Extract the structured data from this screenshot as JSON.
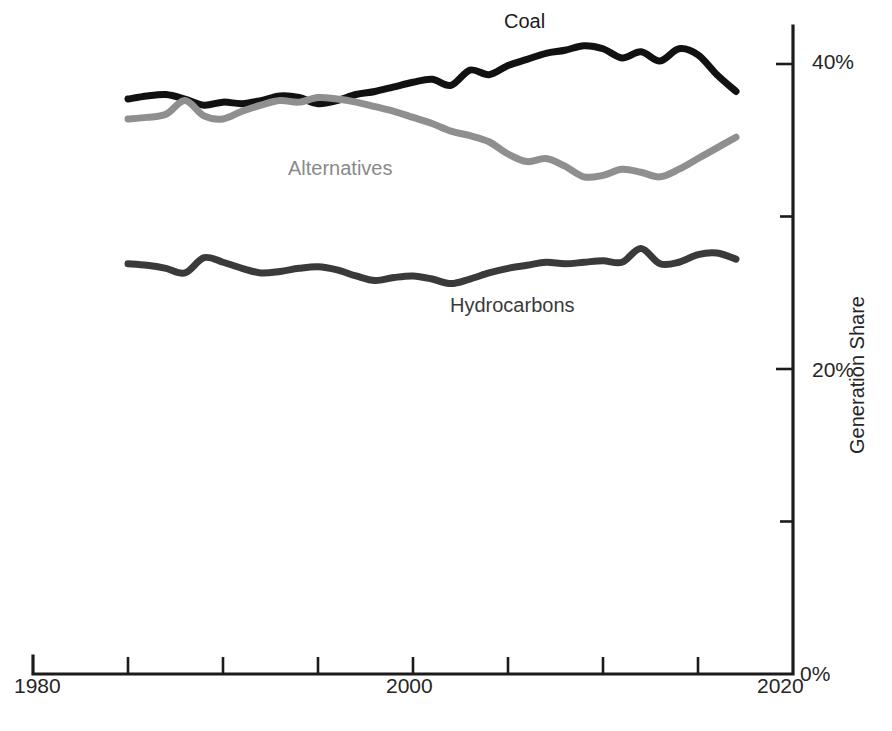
{
  "chart_data": {
    "type": "line",
    "title": "",
    "xlabel": "",
    "ylabel": "Generation Share",
    "xlim": [
      1980,
      2020
    ],
    "ylim": [
      0,
      43
    ],
    "grid": false,
    "legend_position": "inline-labels",
    "y_tick_labels": [
      "0%",
      "20%",
      "40%"
    ],
    "y_ticks_major": [
      0,
      20,
      40
    ],
    "y_ticks_minor": [
      10,
      30
    ],
    "x_tick_labels": [
      "1980",
      "2000",
      "2020"
    ],
    "x_ticks": [
      1980,
      1985,
      1990,
      1995,
      2000,
      2005,
      2010,
      2015,
      2020
    ],
    "y_unit": "%",
    "x": [
      1985,
      1986,
      1987,
      1988,
      1989,
      1990,
      1991,
      1992,
      1993,
      1994,
      1995,
      1996,
      1997,
      1998,
      1999,
      2000,
      2001,
      2002,
      2003,
      2004,
      2005,
      2006,
      2007,
      2008,
      2009,
      2010,
      2011,
      2012,
      2013,
      2014,
      2015,
      2016,
      2017
    ],
    "series": [
      {
        "name": "Coal",
        "color": "#111111",
        "label_x": 2009.3,
        "label_y": 42.8,
        "values": [
          37.7,
          37.9,
          38.0,
          37.7,
          37.3,
          37.5,
          37.4,
          37.6,
          37.9,
          37.8,
          37.4,
          37.6,
          38.0,
          38.2,
          38.5,
          38.8,
          39.0,
          38.6,
          39.6,
          39.3,
          39.9,
          40.3,
          40.7,
          40.9,
          41.2,
          41.0,
          40.4,
          40.8,
          40.2,
          41.0,
          40.6,
          39.3,
          38.2
        ]
      },
      {
        "name": "Alternatives",
        "color": "#8f8f8f",
        "label_x": 1995.2,
        "label_y": 33.3,
        "values": [
          36.4,
          36.5,
          36.7,
          37.6,
          36.6,
          36.4,
          36.9,
          37.3,
          37.6,
          37.5,
          37.8,
          37.7,
          37.5,
          37.2,
          36.9,
          36.5,
          36.1,
          35.6,
          35.3,
          34.9,
          34.1,
          33.6,
          33.8,
          33.3,
          32.6,
          32.7,
          33.1,
          32.9,
          32.6,
          33.1,
          33.8,
          34.5,
          35.2
        ]
      },
      {
        "name": "Hydrocarbons",
        "color": "#3a3a3a",
        "label_x": 2003.6,
        "label_y": 24.5,
        "values": [
          26.9,
          26.8,
          26.6,
          26.3,
          27.3,
          27.0,
          26.6,
          26.3,
          26.4,
          26.6,
          26.7,
          26.5,
          26.1,
          25.8,
          26.0,
          26.1,
          25.9,
          25.6,
          25.9,
          26.3,
          26.6,
          26.8,
          27.0,
          26.9,
          27.0,
          27.1,
          27.0,
          27.9,
          26.9,
          27.0,
          27.5,
          27.6,
          27.2
        ]
      }
    ]
  },
  "axis": {
    "y_label_40": "40%",
    "y_label_20": "20%",
    "y_label_0": "0%",
    "x_label_1980": "1980",
    "x_label_2000": "2000",
    "x_label_2020": "2020",
    "y_axis_title": "Generation Share"
  },
  "series_labels": {
    "coal": "Coal",
    "alternatives": "Alternatives",
    "hydrocarbons": "Hydrocarbons"
  },
  "footer": {
    "cropped_caption": "                 "
  }
}
